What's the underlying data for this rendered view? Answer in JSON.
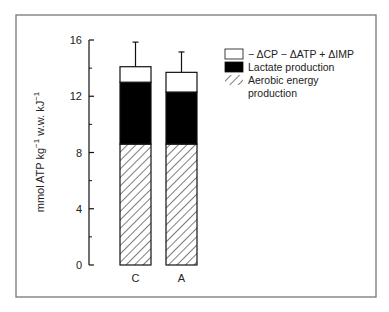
{
  "chart_data": {
    "type": "bar",
    "stacked": true,
    "title": "",
    "xlabel": "",
    "ylabel": "mmol ATP kg⁻¹ w.w. kJ⁻¹",
    "ylabel_parts": [
      "mmol ATP kg",
      "−1",
      " w.w. kJ",
      "−1"
    ],
    "ylim": [
      0,
      16
    ],
    "yticks": [
      0,
      4,
      8,
      12,
      16
    ],
    "yticks_minor": [
      2,
      6,
      10,
      14
    ],
    "categories": [
      "C",
      "A"
    ],
    "series": [
      {
        "name": "Aerobic energy production",
        "fill": "hatch",
        "values": [
          8.6,
          8.6
        ]
      },
      {
        "name": "Lactate production",
        "fill": "#000000",
        "values": [
          4.4,
          3.7
        ]
      },
      {
        "name": "− ΔCP − ΔATP + ΔIMP",
        "fill": "#ffffff",
        "values": [
          1.1,
          1.4
        ]
      }
    ],
    "totals": [
      14.1,
      13.7
    ],
    "error_bars_upper": [
      1.75,
      1.45
    ],
    "grid": false,
    "legend_position": "top-right",
    "legend": [
      {
        "label": "− ΔCP − ΔATP + ΔIMP",
        "fill": "white"
      },
      {
        "label": "Lactate production",
        "fill": "black"
      },
      {
        "label": "Aerobic energy",
        "label2": "production",
        "fill": "hatch"
      }
    ]
  }
}
